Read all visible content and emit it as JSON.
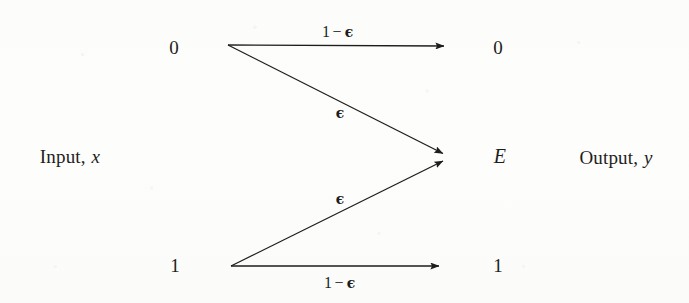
{
  "figure": {
    "kind": "binary-erasure-channel-diagram",
    "width": 689,
    "height": 303,
    "background_color": "#fdfdfb",
    "ink_color": "#1d1d1d"
  },
  "captions": {
    "input": {
      "text": "Input,",
      "variable": "x"
    },
    "output": {
      "text": "Output,",
      "variable": "y"
    }
  },
  "input_nodes": [
    {
      "id": "in-0",
      "label": "0",
      "x": 174,
      "y": 47
    },
    {
      "id": "in-1",
      "label": "1",
      "x": 175,
      "y": 265
    }
  ],
  "output_nodes": [
    {
      "id": "out-0",
      "label": "0",
      "x": 498,
      "y": 47
    },
    {
      "id": "out-E",
      "label": "E",
      "x": 500,
      "y": 156,
      "italic": true
    },
    {
      "id": "out-1",
      "label": "1",
      "x": 498,
      "y": 265
    }
  ],
  "edges": [
    {
      "id": "edge-0-0",
      "from": "in-0",
      "to": "out-0",
      "prob_prefix": "1",
      "prob_minus": "−",
      "prob_epsilon": "ϵ",
      "label_text": "1 − ϵ",
      "label_x": 338,
      "label_y": 32,
      "x1": 228,
      "y1": 45,
      "x2": 448,
      "y2": 46
    },
    {
      "id": "edge-0-E",
      "from": "in-0",
      "to": "out-E",
      "prob_epsilon": "ϵ",
      "label_text": "ϵ",
      "label_x": 340,
      "label_y": 113,
      "x1": 228,
      "y1": 45,
      "x2": 447,
      "y2": 155
    },
    {
      "id": "edge-1-E",
      "from": "in-1",
      "to": "out-E",
      "prob_epsilon": "ϵ",
      "label_text": "ϵ",
      "label_x": 340,
      "label_y": 199,
      "x1": 231,
      "y1": 266,
      "x2": 447,
      "y2": 160
    },
    {
      "id": "edge-1-1",
      "from": "in-1",
      "to": "out-1",
      "prob_prefix": "1",
      "prob_minus": "−",
      "prob_epsilon": "ϵ",
      "label_text": "1 − ϵ",
      "label_x": 340,
      "label_y": 283,
      "x1": 231,
      "y1": 266,
      "x2": 443,
      "y2": 266
    }
  ],
  "caption_positions": {
    "input": {
      "x": 70,
      "y": 156
    },
    "output": {
      "x": 616,
      "y": 157
    }
  }
}
